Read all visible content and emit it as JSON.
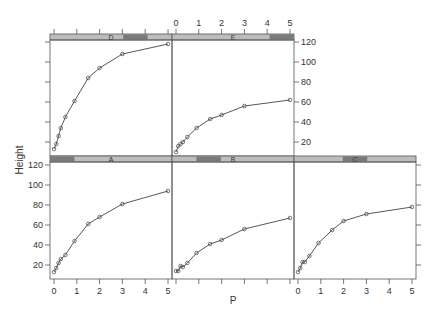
{
  "chart_data": {
    "type": "line",
    "layout": "trellis (lattice xyplot), 2 rows: top row D,E; bottom row A,B,C",
    "xlabel": "P",
    "ylabel": "Height",
    "xlim": [
      0,
      5
    ],
    "ylim": [
      10,
      122
    ],
    "x_ticks": [
      0,
      1,
      2,
      3,
      4,
      5
    ],
    "y_ticks": [
      20,
      40,
      60,
      80,
      100,
      120
    ],
    "x": [
      0,
      0.1,
      0.2,
      0.3,
      0.5,
      0.9,
      1.5,
      2,
      3,
      5
    ],
    "marker": "open circle",
    "series": [
      {
        "name": "D",
        "values": [
          13,
          18,
          26,
          34,
          45,
          61,
          84,
          94,
          108,
          118
        ]
      },
      {
        "name": "E",
        "values": [
          10,
          16,
          18,
          20,
          25,
          34,
          43,
          47,
          56,
          62
        ]
      },
      {
        "name": "A",
        "values": [
          13,
          17,
          22,
          26,
          30,
          44,
          61,
          68,
          81,
          94
        ]
      },
      {
        "name": "B",
        "values": [
          14,
          14,
          19,
          18,
          22,
          32,
          41,
          45,
          56,
          67
        ]
      },
      {
        "name": "C",
        "values": [
          13,
          17,
          23,
          23,
          29,
          42,
          55,
          64,
          71,
          78
        ]
      }
    ],
    "grid": false,
    "legend": "none (strip labels per panel)"
  },
  "panels": [
    {
      "id": "D",
      "label": "D",
      "row": 0,
      "col": 0
    },
    {
      "id": "E",
      "label": "E",
      "row": 0,
      "col": 1
    },
    {
      "id": "A",
      "label": "A",
      "row": 1,
      "col": 0
    },
    {
      "id": "B",
      "label": "B",
      "row": 1,
      "col": 1
    },
    {
      "id": "C",
      "label": "C",
      "row": 1,
      "col": 2
    }
  ],
  "colors": {
    "strip_light": "#bdbdbd",
    "strip_dark": "#7a7a7a",
    "line": "#444444",
    "axis": "#555555"
  }
}
